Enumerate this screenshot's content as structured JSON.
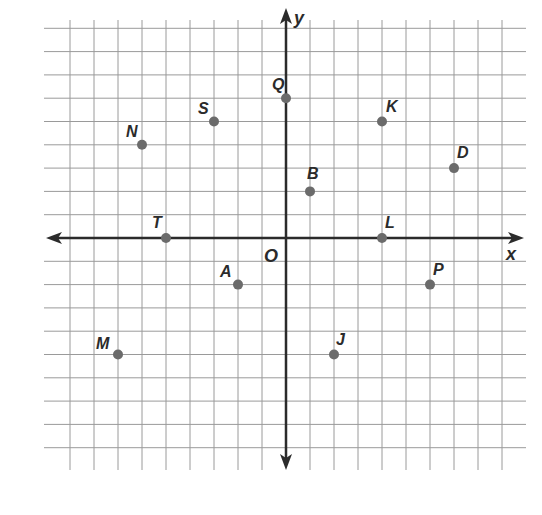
{
  "plane": {
    "x_axis_label": "x",
    "y_axis_label": "y",
    "origin_label": "O",
    "grid": {
      "x_min": -9,
      "x_max": 9,
      "y_min": -9,
      "y_max": 9,
      "step": 1
    },
    "colors": {
      "grid": "#9a9a9a",
      "axis": "#2b2b2b",
      "point": "#6b6b6b",
      "label": "#2b2b2b"
    }
  },
  "points": [
    {
      "name": "Q",
      "x": 0,
      "y": 6,
      "label_dx": -14,
      "label_dy": -8
    },
    {
      "name": "S",
      "x": -3,
      "y": 5,
      "label_dx": -16,
      "label_dy": -8
    },
    {
      "name": "N",
      "x": -6,
      "y": 4,
      "label_dx": -16,
      "label_dy": -8
    },
    {
      "name": "T",
      "x": -5,
      "y": 0,
      "label_dx": -14,
      "label_dy": -10
    },
    {
      "name": "K",
      "x": 4,
      "y": 5,
      "label_dx": 4,
      "label_dy": -10
    },
    {
      "name": "D",
      "x": 7,
      "y": 3,
      "label_dx": 3,
      "label_dy": -10
    },
    {
      "name": "B",
      "x": 1,
      "y": 2,
      "label_dx": -3,
      "label_dy": -12
    },
    {
      "name": "L",
      "x": 4,
      "y": 0,
      "label_dx": 3,
      "label_dy": -10
    },
    {
      "name": "A",
      "x": -2,
      "y": -2,
      "label_dx": -18,
      "label_dy": -8
    },
    {
      "name": "M",
      "x": -7,
      "y": -5,
      "label_dx": -22,
      "label_dy": -6
    },
    {
      "name": "P",
      "x": 6,
      "y": -2,
      "label_dx": 3,
      "label_dy": -10
    },
    {
      "name": "J",
      "x": 2,
      "y": -5,
      "label_dx": 2,
      "label_dy": -10
    }
  ]
}
